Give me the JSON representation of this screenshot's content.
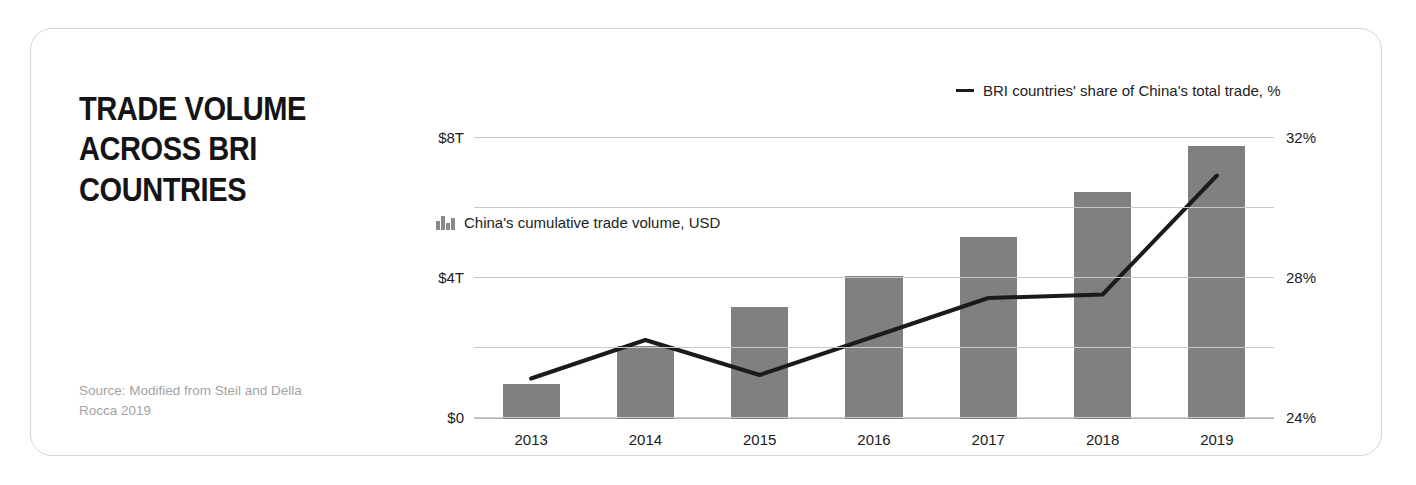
{
  "card": {
    "title": "TRADE VOLUME ACROSS BRI COUNTRIES",
    "title_lines": [
      "TRADE VOLUME",
      "ACROSS BRI",
      "COUNTRIES"
    ],
    "source": "Source: Modified from Steil and Della Rocca 2019"
  },
  "legend": {
    "bars": {
      "icon": "bar-chart-icon",
      "label": "China's cumulative trade volume, USD"
    },
    "line": {
      "icon": "line-dash-icon",
      "label": "BRI countries' share of China's total trade, %"
    }
  },
  "colors": {
    "bar_fill": "#808080",
    "line_stroke": "#1b1b1b",
    "gridline": "#c9c9c9",
    "card_border": "#d7d7d7",
    "title_text": "#141414",
    "source_text": "#a3a3a3"
  },
  "chart_data": {
    "type": "bar",
    "title": "TRADE VOLUME ACROSS BRI COUNTRIES",
    "subtitle": "",
    "xlabel": "",
    "categories": [
      "2013",
      "2014",
      "2015",
      "2016",
      "2017",
      "2018",
      "2019"
    ],
    "grid": true,
    "legend_position": "top",
    "axes": {
      "left": {
        "label": "China's cumulative trade volume, USD",
        "ylim": [
          0,
          8
        ],
        "unit": "T",
        "ticks": [
          {
            "value": 0,
            "label": "$0",
            "shown": true
          },
          {
            "value": 2,
            "label": "",
            "shown": false
          },
          {
            "value": 4,
            "label": "$4T",
            "shown": true
          },
          {
            "value": 6,
            "label": "",
            "shown": false
          },
          {
            "value": 8,
            "label": "$8T",
            "shown": true
          }
        ]
      },
      "right": {
        "label": "BRI countries' share of China's total trade, %",
        "ylim": [
          24,
          32
        ],
        "unit": "%",
        "ticks": [
          {
            "value": 24,
            "label": "24%",
            "shown": true
          },
          {
            "value": 26,
            "label": "",
            "shown": false
          },
          {
            "value": 28,
            "label": "28%",
            "shown": true
          },
          {
            "value": 30,
            "label": "",
            "shown": false
          },
          {
            "value": 32,
            "label": "32%",
            "shown": true
          }
        ]
      }
    },
    "series": [
      {
        "name": "China's cumulative trade volume, USD",
        "type": "bar",
        "axis": "left",
        "unit": "trillion USD",
        "values": [
          1.0,
          2.1,
          3.2,
          4.1,
          5.2,
          6.5,
          7.8
        ]
      },
      {
        "name": "BRI countries' share of China's total trade, %",
        "type": "line",
        "axis": "right",
        "unit": "%",
        "values": [
          25.1,
          26.2,
          25.2,
          26.3,
          27.4,
          27.5,
          30.9
        ]
      }
    ]
  }
}
